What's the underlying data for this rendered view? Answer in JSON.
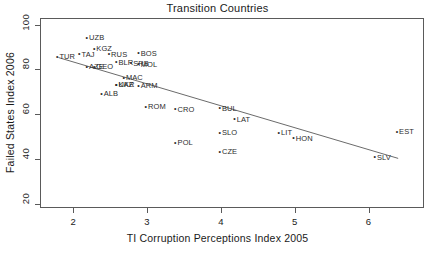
{
  "chart_data": {
    "type": "scatter",
    "title": "Transition Countries",
    "xlabel": "TI Corruption Perceptions Index 2005",
    "ylabel": "Failed States Index 2006",
    "xlim": [
      1.55,
      6.75
    ],
    "ylim": [
      18,
      103
    ],
    "xticks": [
      "2",
      "3",
      "4",
      "5",
      "6"
    ],
    "xtick_values": [
      2,
      3,
      4,
      5,
      6
    ],
    "yticks": [
      "20",
      "40",
      "60",
      "80",
      "100"
    ],
    "ytick_values": [
      20,
      40,
      60,
      80,
      100
    ],
    "grid": false,
    "legend": false,
    "point_marker": "small-dot",
    "trendline": {
      "type": "linear-fit",
      "x_start": 1.8,
      "y_start": 85.3,
      "x_end": 6.4,
      "y_end": 40.2
    },
    "points": [
      {
        "label": "UZB",
        "x": 2.2,
        "y": 94.0
      },
      {
        "label": "KGZ",
        "x": 2.3,
        "y": 89.0
      },
      {
        "label": "TAJ",
        "x": 2.1,
        "y": 86.5
      },
      {
        "label": "RUS",
        "x": 2.5,
        "y": 86.5
      },
      {
        "label": "BOS",
        "x": 2.9,
        "y": 87.0
      },
      {
        "label": "TUR",
        "x": 1.8,
        "y": 85.5
      },
      {
        "label": "BLR",
        "x": 2.6,
        "y": 83.0
      },
      {
        "label": "SRB",
        "x": 2.8,
        "y": 82.5
      },
      {
        "label": "MOL",
        "x": 2.9,
        "y": 82.0
      },
      {
        "label": "AZE",
        "x": 2.2,
        "y": 81.0
      },
      {
        "label": "GEO",
        "x": 2.3,
        "y": 81.0
      },
      {
        "label": "MAC",
        "x": 2.7,
        "y": 76.0
      },
      {
        "label": "UKR",
        "x": 2.6,
        "y": 73.0
      },
      {
        "label": "KAZ",
        "x": 2.6,
        "y": 73.0
      },
      {
        "label": "ARM",
        "x": 2.9,
        "y": 72.5
      },
      {
        "label": "ALB",
        "x": 2.4,
        "y": 69.0
      },
      {
        "label": "ROM",
        "x": 3.0,
        "y": 63.0
      },
      {
        "label": "CRO",
        "x": 3.4,
        "y": 62.0
      },
      {
        "label": "BUL",
        "x": 4.0,
        "y": 62.5
      },
      {
        "label": "LAT",
        "x": 4.2,
        "y": 57.5
      },
      {
        "label": "SLO",
        "x": 4.0,
        "y": 51.5
      },
      {
        "label": "LIT",
        "x": 4.8,
        "y": 51.5
      },
      {
        "label": "HON",
        "x": 5.0,
        "y": 49.0
      },
      {
        "label": "POL",
        "x": 3.4,
        "y": 47.0
      },
      {
        "label": "CZE",
        "x": 4.0,
        "y": 43.0
      },
      {
        "label": "EST",
        "x": 6.4,
        "y": 52.0
      },
      {
        "label": "SLV",
        "x": 6.1,
        "y": 40.5
      }
    ]
  }
}
